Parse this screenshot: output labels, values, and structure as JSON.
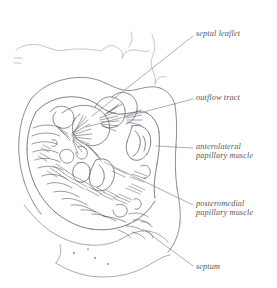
{
  "figure": {
    "background_color": "#ffffff",
    "ink_color": "#5a5a62",
    "faint_ink_color": "#9a9aa2",
    "label_color": "#55555c",
    "leader_color": "#7c7c86"
  },
  "labels": [
    {
      "name": "septal-leaflet",
      "lines": [
        "septal leaflet"
      ],
      "x": 196,
      "y": 29,
      "leader": {
        "x1": 193,
        "y1": 36,
        "x2": 92,
        "y2": 116
      }
    },
    {
      "name": "outflow-tract",
      "lines": [
        "outflow tract"
      ],
      "x": 196,
      "y": 93,
      "leader": {
        "x1": 193,
        "y1": 99,
        "x2": 86,
        "y2": 127
      }
    },
    {
      "name": "anterolateral-papillary-muscle",
      "lines": [
        "anterolateral",
        "papillary muscle"
      ],
      "x": 196,
      "y": 142,
      "leader": {
        "x1": 193,
        "y1": 148,
        "x2": 156,
        "y2": 146
      }
    },
    {
      "name": "posteromedial-papillary-muscle",
      "lines": [
        "posteromedial",
        "papillary muscle"
      ],
      "x": 196,
      "y": 199,
      "leader": {
        "x1": 193,
        "y1": 205,
        "x2": 104,
        "y2": 162
      }
    },
    {
      "name": "septum",
      "lines": [
        "septum"
      ],
      "x": 196,
      "y": 262,
      "leader": {
        "x1": 193,
        "y1": 266,
        "x2": 143,
        "y2": 229
      }
    }
  ]
}
